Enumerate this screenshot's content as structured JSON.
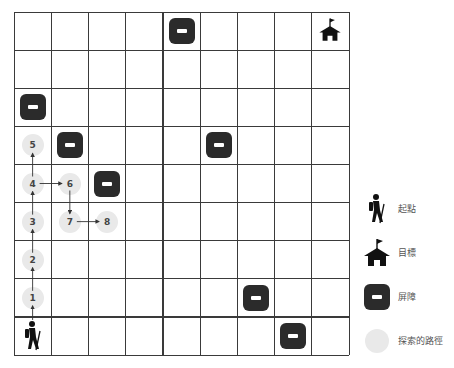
{
  "grid": {
    "cols": 9,
    "rows": 9,
    "origin_x": 14,
    "origin_y": 12,
    "width": 335,
    "height": 343,
    "line_color": "#3a3a3a"
  },
  "start": {
    "col": 0,
    "row": 8,
    "icon": "hiker-icon"
  },
  "goal": {
    "col": 8,
    "row": 0,
    "icon": "house-flag-icon"
  },
  "barriers": [
    {
      "col": 4,
      "row": 0
    },
    {
      "col": 0,
      "row": 2
    },
    {
      "col": 1,
      "row": 3
    },
    {
      "col": 5,
      "row": 3
    },
    {
      "col": 2,
      "row": 4
    },
    {
      "col": 6,
      "row": 7
    },
    {
      "col": 7,
      "row": 8
    }
  ],
  "path_nodes": [
    {
      "label": "1",
      "col": 0,
      "row": 7
    },
    {
      "label": "2",
      "col": 0,
      "row": 6
    },
    {
      "label": "3",
      "col": 0,
      "row": 5
    },
    {
      "label": "4",
      "col": 0,
      "row": 4
    },
    {
      "label": "5",
      "col": 0,
      "row": 3
    },
    {
      "label": "6",
      "col": 1,
      "row": 4
    },
    {
      "label": "7",
      "col": 1,
      "row": 5
    },
    {
      "label": "8",
      "col": 2,
      "row": 5
    }
  ],
  "path_edges": [
    {
      "from": "start",
      "to": "1"
    },
    {
      "from": "1",
      "to": "2"
    },
    {
      "from": "2",
      "to": "3"
    },
    {
      "from": "3",
      "to": "4"
    },
    {
      "from": "4",
      "to": "5"
    },
    {
      "from": "4",
      "to": "6"
    },
    {
      "from": "6",
      "to": "7"
    },
    {
      "from": "7",
      "to": "8"
    }
  ],
  "legend": {
    "start_label": "起點",
    "goal_label": "目標",
    "barrier_label": "屏障",
    "explored_label": "探索的路徑"
  },
  "colors": {
    "barrier": "#2b2b2b",
    "explored": "#e9e9e9",
    "icon": "#111111",
    "arrow": "#333333"
  }
}
